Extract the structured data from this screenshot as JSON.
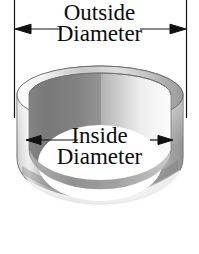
{
  "figure": {
    "kind": "technical-illustration",
    "background_color": "#ffffff",
    "line_color": "#111111"
  },
  "annotations": {
    "outside": {
      "line1": "Outside",
      "line2": "Diameter",
      "dimension_name": "outside-diameter",
      "arrow_y": 29,
      "left_tick_x": 14,
      "right_tick_x": 187,
      "tick_top": 0,
      "tick_bottom": 118
    },
    "inside": {
      "line1": "Inside",
      "line2": "Diameter",
      "dimension_name": "inside-diameter",
      "arrow_y": 140,
      "left_arrow_x": 26,
      "right_arrow_x": 173
    }
  },
  "ring": {
    "outer_center_x": 100,
    "outer_top_y": 66,
    "outer_left_x": 17,
    "outer_right_x": 183,
    "wall_thickness": 9,
    "colors": {
      "rim_light": "#f2f2f2",
      "rim_mid": "#c9c9c9",
      "rim_dark": "#8f8f8f",
      "bore_dark": "#6e6e6e",
      "bore_light": "#fbfbfb",
      "bore_white": "#ffffff",
      "body_light": "#ededed",
      "body_mid": "#bcbcbc",
      "body_dark": "#9a9a9a",
      "outline": "#5a5a5a"
    }
  }
}
